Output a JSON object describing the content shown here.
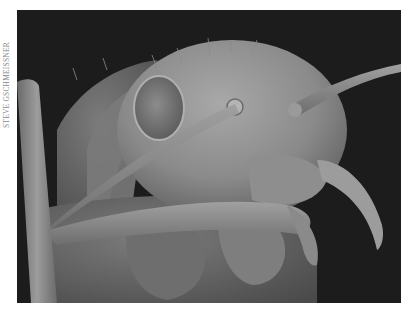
{
  "figure": {
    "photo_credit": "STEVE GSCHMEISSNER",
    "colors": {
      "background": "#1c1c1c",
      "body_light": "#9a9a9a",
      "body_mid": "#7a7a7a",
      "body_dark": "#555555",
      "page": "#ffffff",
      "credit_text": "#8a8a8a"
    }
  }
}
